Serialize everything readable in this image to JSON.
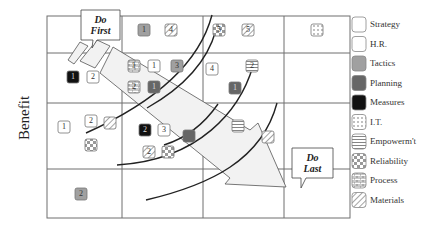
{
  "axis": {
    "ylabel": "Benefit"
  },
  "callouts": {
    "do_first": {
      "line1": "Do",
      "line2": "First"
    },
    "do_last": {
      "line1": "Do",
      "line2": "Last"
    }
  },
  "legend": [
    {
      "label": "Strategy",
      "pattern": "white"
    },
    {
      "label": "H.R.",
      "pattern": "white"
    },
    {
      "label": "Tactics",
      "pattern": "gray"
    },
    {
      "label": "Planning",
      "pattern": "dark-gray"
    },
    {
      "label": "Measures",
      "pattern": "black"
    },
    {
      "label": "I.T.",
      "pattern": "dots"
    },
    {
      "label": "Empowerm't",
      "pattern": "hlines"
    },
    {
      "label": "Reliability",
      "pattern": "checker"
    },
    {
      "label": "Process",
      "pattern": "brick"
    },
    {
      "label": "Materials",
      "pattern": "diagonal"
    }
  ],
  "items": [
    {
      "num": "1",
      "category": "Tactics",
      "x": 138,
      "y": 24
    },
    {
      "num": "4",
      "category": "Materials",
      "x": 165,
      "y": 24
    },
    {
      "num": "5",
      "category": "Reliability",
      "x": 213,
      "y": 24
    },
    {
      "num": "5",
      "category": "Materials",
      "x": 242,
      "y": 24
    },
    {
      "num": "",
      "category": "I.T.",
      "x": 311,
      "y": 24
    },
    {
      "num": "1",
      "category": "Measures",
      "x": 67,
      "y": 71
    },
    {
      "num": "2",
      "category": "H.R.",
      "x": 87,
      "y": 71
    },
    {
      "num": "1",
      "category": "Process",
      "x": 128,
      "y": 60
    },
    {
      "num": "1",
      "category": "Strategy",
      "x": 148,
      "y": 60
    },
    {
      "num": "3",
      "category": "Tactics",
      "x": 171,
      "y": 60
    },
    {
      "num": "2",
      "category": "Process",
      "x": 128,
      "y": 81
    },
    {
      "num": "1",
      "category": "Planning",
      "x": 148,
      "y": 81
    },
    {
      "num": "4",
      "category": "Strategy",
      "x": 206,
      "y": 63
    },
    {
      "num": "2",
      "category": "Empowerm't",
      "x": 246,
      "y": 60
    },
    {
      "num": "1",
      "category": "Planning",
      "x": 229,
      "y": 82
    },
    {
      "num": "1",
      "category": "Strategy",
      "x": 58,
      "y": 121
    },
    {
      "num": "2",
      "category": "H.R.",
      "x": 85,
      "y": 115
    },
    {
      "num": "",
      "category": "Materials",
      "x": 104,
      "y": 117
    },
    {
      "num": "",
      "category": "Reliability",
      "x": 85,
      "y": 139
    },
    {
      "num": "2",
      "category": "Measures",
      "x": 139,
      "y": 124
    },
    {
      "num": "3",
      "category": "H.R.",
      "x": 158,
      "y": 124
    },
    {
      "num": "",
      "category": "Planning",
      "x": 183,
      "y": 130
    },
    {
      "num": "2",
      "category": "Materials",
      "x": 143,
      "y": 146
    },
    {
      "num": "",
      "category": "Reliability",
      "x": 162,
      "y": 146
    },
    {
      "num": "",
      "category": "Empowerm't",
      "x": 232,
      "y": 120
    },
    {
      "num": "",
      "category": "Materials",
      "x": 262,
      "y": 131
    },
    {
      "num": "2",
      "category": "Tactics",
      "x": 75,
      "y": 188
    }
  ],
  "colors": {
    "grid": "#6f6f6f",
    "gray": "#a0a0a0",
    "dark_gray": "#666666",
    "black": "#111111",
    "arrow_fill": "#f2f2f2"
  }
}
